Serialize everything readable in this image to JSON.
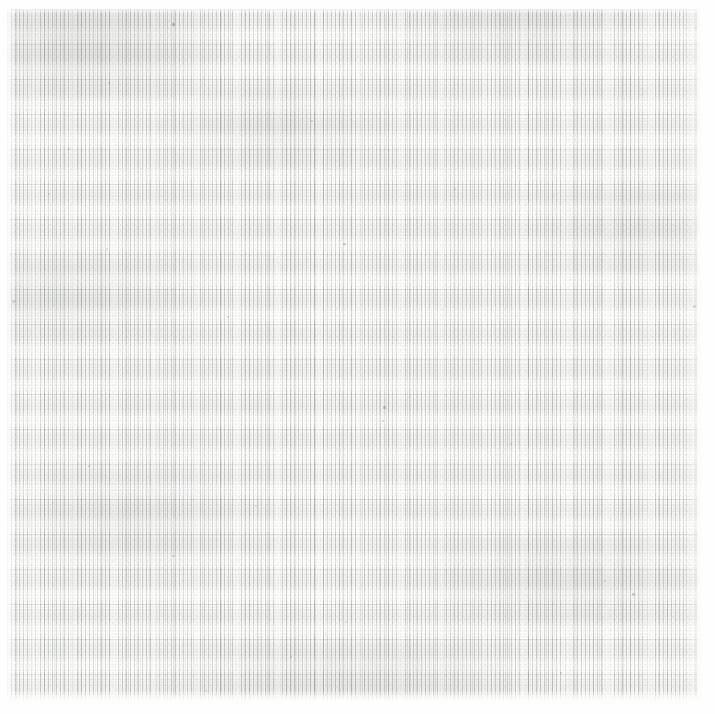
{
  "artwork": {
    "medium": "graphite pencil on paper",
    "composition": "vertical hatching in horizontal bands",
    "canvas": {
      "width_px": 715,
      "height_px": 714
    },
    "drawing_field": {
      "inset_left_px": 7,
      "inset_top_px": 9,
      "inset_right_px": 14,
      "inset_bottom_px": 13,
      "width_px": 694,
      "height_px": 692
    },
    "marks": {
      "vertical_hatch_pitch_px": 4,
      "horizontal_band_period_px": 35,
      "band_count": 20
    },
    "palette": {
      "paper_white": "#fefefe",
      "paper_tone": "#fdfdfc",
      "graphite_darkest": "#cdcfcc",
      "graphite_mid": "#dcdedа",
      "graphite_lightest": "#ebece8",
      "stroke_gray": "#74786f",
      "speck_dark": "#484a46"
    },
    "tonal_gradient": {
      "description": "darkest along the top edge and upper-left, lightening toward the centre-right, faintly re-darkening near the lower bands",
      "stops": [
        {
          "position_pct": 0,
          "value": "#cdcfcc"
        },
        {
          "position_pct": 10,
          "value": "#dcdedа"
        },
        {
          "position_pct": 28,
          "value": "#e7e8e4"
        },
        {
          "position_pct": 52,
          "value": "#ebece8"
        },
        {
          "position_pct": 74,
          "value": "#e6e7e3"
        },
        {
          "position_pct": 91,
          "value": "#dfe1dd"
        },
        {
          "position_pct": 100,
          "value": "#e6e7e4"
        }
      ]
    },
    "specks": [
      {
        "x_px": 172,
        "y_px": 23,
        "w_px": 3,
        "h_px": 3,
        "opacity": 0.55
      },
      {
        "x_px": 695,
        "y_px": 27,
        "w_px": 2,
        "h_px": 2,
        "opacity": 0.4
      },
      {
        "x_px": 108,
        "y_px": 82,
        "w_px": 2,
        "h_px": 2,
        "opacity": 0.35
      },
      {
        "x_px": 311,
        "y_px": 120,
        "w_px": 2,
        "h_px": 2,
        "opacity": 0.3
      },
      {
        "x_px": 68,
        "y_px": 148,
        "w_px": 2,
        "h_px": 2,
        "opacity": 0.35
      },
      {
        "x_px": 48,
        "y_px": 193,
        "w_px": 2,
        "h_px": 2,
        "opacity": 0.3
      },
      {
        "x_px": 343,
        "y_px": 243,
        "w_px": 3,
        "h_px": 2,
        "opacity": 0.45
      },
      {
        "x_px": 693,
        "y_px": 305,
        "w_px": 3,
        "h_px": 3,
        "opacity": 0.5
      },
      {
        "x_px": 227,
        "y_px": 316,
        "w_px": 2,
        "h_px": 2,
        "opacity": 0.3
      },
      {
        "x_px": 383,
        "y_px": 406,
        "w_px": 3,
        "h_px": 3,
        "opacity": 0.5
      },
      {
        "x_px": 382,
        "y_px": 420,
        "w_px": 2,
        "h_px": 2,
        "opacity": 0.35
      },
      {
        "x_px": 510,
        "y_px": 443,
        "w_px": 2,
        "h_px": 2,
        "opacity": 0.3
      },
      {
        "x_px": 88,
        "y_px": 465,
        "w_px": 2,
        "h_px": 2,
        "opacity": 0.3
      },
      {
        "x_px": 255,
        "y_px": 505,
        "w_px": 2,
        "h_px": 2,
        "opacity": 0.28
      },
      {
        "x_px": 172,
        "y_px": 555,
        "w_px": 3,
        "h_px": 2,
        "opacity": 0.32
      },
      {
        "x_px": 632,
        "y_px": 593,
        "w_px": 3,
        "h_px": 3,
        "opacity": 0.48
      },
      {
        "x_px": 604,
        "y_px": 580,
        "w_px": 2,
        "h_px": 2,
        "opacity": 0.3
      },
      {
        "x_px": 345,
        "y_px": 621,
        "w_px": 2,
        "h_px": 2,
        "opacity": 0.28
      },
      {
        "x_px": 290,
        "y_px": 656,
        "w_px": 2,
        "h_px": 2,
        "opacity": 0.3
      },
      {
        "x_px": 106,
        "y_px": 248,
        "w_px": 2,
        "h_px": 2,
        "opacity": 0.28
      },
      {
        "x_px": 12,
        "y_px": 300,
        "w_px": 3,
        "h_px": 3,
        "opacity": 0.42
      },
      {
        "x_px": 454,
        "y_px": 188,
        "w_px": 2,
        "h_px": 2,
        "opacity": 0.26
      },
      {
        "x_px": 560,
        "y_px": 672,
        "w_px": 2,
        "h_px": 2,
        "opacity": 0.3
      },
      {
        "x_px": 205,
        "y_px": 690,
        "w_px": 2,
        "h_px": 2,
        "opacity": 0.26
      }
    ]
  }
}
